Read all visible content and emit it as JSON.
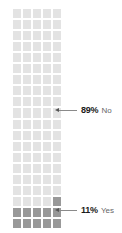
{
  "chart_data": {
    "type": "waffle",
    "title": "",
    "subtitle": "",
    "xlabel": "",
    "ylabel": "",
    "grid": {
      "columns": 5,
      "rows": 20,
      "total_cells": 100,
      "fill_order": "bottom-up"
    },
    "categories": [
      "Yes",
      "No"
    ],
    "values": [
      11,
      89
    ],
    "units": "percent",
    "legend_position": "right-inline-callouts",
    "series": [
      {
        "name": "Yes",
        "value": 11,
        "value_label": "11%",
        "category_label": "Yes",
        "color": "#999999",
        "cells": 11
      },
      {
        "name": "No",
        "value": 89,
        "value_label": "89%",
        "category_label": "No",
        "color": "#e3e3e3",
        "cells": 89
      }
    ],
    "annotations": [
      {
        "value_label": "89%",
        "category_label": "No",
        "target": "no-region"
      },
      {
        "value_label": "11%",
        "category_label": "Yes",
        "target": "yes-region"
      }
    ]
  },
  "colors": {
    "no_fill": "#e3e3e3",
    "yes_fill": "#999999",
    "cell_gap": "#ffffff",
    "leader_line": "#8a8a8a",
    "arrow": "#555555",
    "percent_text": "#1a1a1a",
    "label_text": "#666666",
    "background": "#ffffff"
  },
  "callouts": {
    "no": {
      "percent": "89%",
      "label": "No"
    },
    "yes": {
      "percent": "11%",
      "label": "Yes"
    }
  }
}
